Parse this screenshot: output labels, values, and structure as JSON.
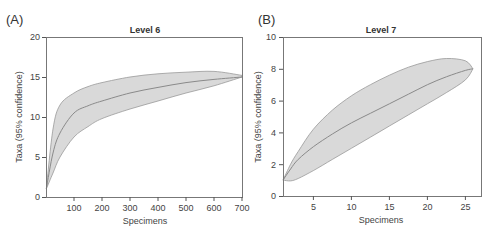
{
  "chart_data": [
    {
      "panel": "(A)",
      "type": "area",
      "title": "Level 6",
      "xlabel": "Specimens",
      "ylabel": "Taxa (95% confidence)",
      "xlim": [
        0,
        700
      ],
      "ylim": [
        0,
        20
      ],
      "xticks": [
        100,
        200,
        300,
        400,
        500,
        600,
        700
      ],
      "yticks": [
        0,
        5,
        10,
        15,
        20
      ],
      "grid": false,
      "x": [
        1,
        25,
        50,
        100,
        150,
        200,
        300,
        400,
        500,
        600,
        700
      ],
      "series": [
        {
          "name": "upper 95% CI",
          "values": [
            1,
            8.5,
            11.5,
            13.0,
            13.8,
            14.3,
            15.0,
            15.4,
            15.6,
            15.7,
            15.2
          ]
        },
        {
          "name": "mean",
          "values": [
            1,
            5.5,
            8.0,
            10.5,
            11.4,
            12.0,
            13.0,
            13.7,
            14.3,
            14.7,
            15.0
          ]
        },
        {
          "name": "lower 95% CI",
          "values": [
            1,
            3.0,
            5.0,
            7.5,
            8.8,
            9.8,
            11.0,
            12.0,
            13.0,
            13.9,
            15.0
          ]
        }
      ]
    },
    {
      "panel": "(B)",
      "type": "area",
      "title": "Level 7",
      "xlabel": "Specimens",
      "ylabel": "Taxa (95% confidence)",
      "xlim": [
        0,
        26
      ],
      "ylim": [
        0,
        10
      ],
      "xticks": [
        5,
        10,
        15,
        20,
        25
      ],
      "yticks": [
        0,
        2,
        4,
        6,
        8,
        10
      ],
      "grid": false,
      "x": [
        1,
        2,
        3,
        5,
        7.5,
        10,
        12.5,
        15,
        17.5,
        20,
        22.5,
        25,
        26
      ],
      "series": [
        {
          "name": "upper 95% CI",
          "values": [
            1,
            2.0,
            2.8,
            4.2,
            5.4,
            6.3,
            7.0,
            7.6,
            8.1,
            8.45,
            8.65,
            8.5,
            8.0
          ]
        },
        {
          "name": "mean",
          "values": [
            1,
            1.7,
            2.3,
            3.1,
            3.9,
            4.6,
            5.2,
            5.8,
            6.4,
            7.0,
            7.5,
            7.9,
            8.0
          ]
        },
        {
          "name": "lower 95% CI",
          "values": [
            1,
            0.95,
            1.1,
            1.6,
            2.3,
            3.0,
            3.7,
            4.4,
            5.1,
            5.8,
            6.5,
            7.3,
            8.0
          ]
        }
      ]
    }
  ],
  "panels": [
    {
      "label": "(A)",
      "title": "Level 6",
      "xlabel": "Specimens",
      "ylabel": "Taxa (95% confidence)",
      "xtick_labels": [
        "100",
        "200",
        "300",
        "400",
        "500",
        "600",
        "700"
      ],
      "ytick_labels": [
        "0",
        "5",
        "10",
        "15",
        "20"
      ]
    },
    {
      "label": "(B)",
      "title": "Level 7",
      "xlabel": "Specimens",
      "ylabel": "Taxa (95% confidence)",
      "xtick_labels": [
        "5",
        "10",
        "15",
        "20",
        "25"
      ],
      "ytick_labels": [
        "0",
        "2",
        "4",
        "6",
        "8",
        "10"
      ]
    }
  ],
  "colors": {
    "band_fill": "#d9d9d9",
    "band_stroke": "#999999",
    "mean_line": "#8a8a8a",
    "frame": "#777777"
  }
}
